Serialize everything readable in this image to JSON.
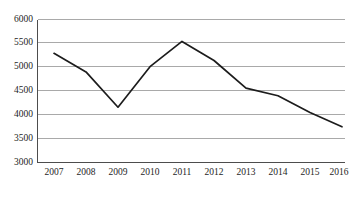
{
  "chart_data": {
    "type": "line",
    "title": "",
    "subtitle": "",
    "xlabel": "",
    "ylabel": "",
    "categories": [
      "2007",
      "2008",
      "2009",
      "2010",
      "2011",
      "2012",
      "2013",
      "2014",
      "2015",
      "2016"
    ],
    "x": [
      2007,
      2008,
      2009,
      2010,
      2011,
      2012,
      2013,
      2014,
      2015,
      2016
    ],
    "values": [
      5290,
      4900,
      4160,
      5010,
      5540,
      5140,
      4560,
      4400,
      4050,
      3750
    ],
    "series": [
      {
        "name": "",
        "values": [
          5290,
          4900,
          4160,
          5010,
          5540,
          5140,
          4560,
          4400,
          4050,
          3750
        ]
      }
    ],
    "ylim": [
      3000,
      6000
    ],
    "ytick_step": 500,
    "ytick_labels": [
      "3000",
      "3500",
      "4000",
      "4500",
      "5000",
      "5500",
      "6000"
    ],
    "ytick_values": [
      3000,
      3500,
      4000,
      4500,
      5000,
      5500,
      6000
    ],
    "xtick_labels": [
      "2007",
      "2008",
      "2009",
      "2010",
      "2011",
      "2012",
      "2013",
      "2014",
      "2015",
      "2016"
    ],
    "grid": true,
    "grid_axis": "y",
    "legend": false,
    "legend_position": "none",
    "annotations": []
  },
  "style": {
    "line_color": "#1c1c1c",
    "grid_color": "#a9a9a9",
    "axis_color": "#4d4d4d",
    "background": "#ffffff",
    "text_color": "#1d1d1d"
  },
  "ylabels": {
    "t6000": "6000",
    "t5500": "5500",
    "t5000": "5000",
    "t4500": "4500",
    "t4000": "4000",
    "t3500": "3500",
    "t3000": "3000"
  },
  "xlabels": {
    "y2007": "2007",
    "y2008": "2008",
    "y2009": "2009",
    "y2010": "2010",
    "y2011": "2011",
    "y2012": "2012",
    "y2013": "2013",
    "y2014": "2014",
    "y2015": "2015",
    "y2016": "2016"
  }
}
